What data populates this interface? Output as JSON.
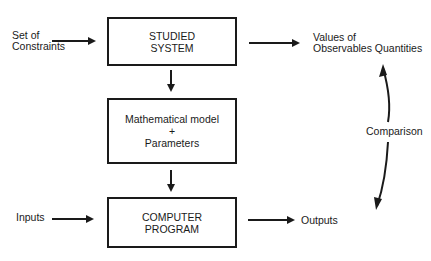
{
  "diagram": {
    "boxes": {
      "studied_system": {
        "line1": "STUDIED",
        "line2": "SYSTEM"
      },
      "math_model": {
        "line1": "Mathematical model",
        "line2": "+",
        "line3": "Parameters"
      },
      "computer_program": {
        "line1": "COMPUTER",
        "line2": "PROGRAM"
      }
    },
    "labels": {
      "constraints_line1": "Set of",
      "constraints_line2": "Constraints",
      "observables_line1": "Values of",
      "observables_line2": "Observables Quantities",
      "inputs": "Inputs",
      "outputs": "Outputs",
      "comparison": "Comparison"
    },
    "colors": {
      "stroke": "#1a1a1a",
      "background": "#ffffff"
    }
  }
}
